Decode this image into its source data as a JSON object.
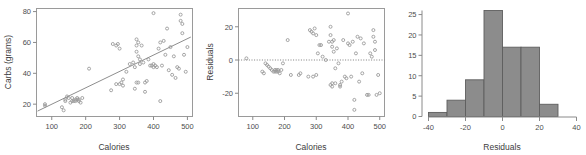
{
  "figure": {
    "title": "",
    "panel_count": 3
  },
  "chart_data": [
    {
      "id": "scatter-carbs-calories",
      "type": "scatter",
      "title": "",
      "xlabel": "Calories",
      "ylabel": "Carbs (grams)",
      "xlim": [
        55,
        515
      ],
      "ylim": [
        12,
        82
      ],
      "xticks": [
        100,
        200,
        300,
        400,
        500
      ],
      "yticks": [
        20,
        40,
        60,
        80
      ],
      "xticklabels": [
        "100",
        "200",
        "300",
        "400",
        "500"
      ],
      "yticklabels": [
        "20",
        "40",
        "60",
        "80"
      ],
      "grid": false,
      "legend": "none",
      "marker": "open-circle",
      "marker_color": "#9b9b9b",
      "fit_line": {
        "type": "linear-regression",
        "x": [
          58,
          510
        ],
        "y": [
          15.5,
          63.5
        ],
        "color": "#8e8e8e"
      },
      "x": [
        80,
        80,
        130,
        135,
        140,
        140,
        145,
        150,
        155,
        160,
        160,
        165,
        170,
        170,
        175,
        175,
        180,
        180,
        185,
        190,
        210,
        275,
        280,
        290,
        290,
        295,
        300,
        300,
        305,
        310,
        310,
        320,
        330,
        340,
        345,
        345,
        350,
        350,
        350,
        350,
        355,
        355,
        355,
        360,
        360,
        365,
        370,
        375,
        375,
        380,
        385,
        390,
        395,
        400,
        400,
        400,
        405,
        410,
        415,
        420,
        420,
        425,
        430,
        435,
        440,
        445,
        450,
        455,
        460,
        465,
        470,
        475,
        480,
        480,
        485,
        485,
        490,
        495,
        500
      ],
      "y": [
        20,
        19,
        18,
        16,
        22,
        23,
        25,
        24,
        21,
        22,
        24,
        22,
        22,
        23,
        23,
        24,
        22,
        23,
        21,
        24,
        43,
        29,
        59,
        58,
        33,
        59,
        33,
        56,
        34,
        36,
        32,
        41,
        46,
        47,
        44,
        30,
        62,
        58,
        54,
        34,
        60,
        51,
        34,
        49,
        46,
        58,
        47,
        34,
        28,
        35,
        49,
        45,
        45,
        79,
        46,
        44,
        45,
        44,
        56,
        60,
        22,
        45,
        61,
        52,
        69,
        42,
        57,
        39,
        51,
        37,
        44,
        43,
        78,
        74,
        72,
        66,
        52,
        41,
        57
      ]
    },
    {
      "id": "scatter-residuals-calories",
      "type": "scatter",
      "title": "",
      "xlabel": "Calories",
      "ylabel": "Residuals",
      "xlim": [
        55,
        515
      ],
      "ylim": [
        -34,
        31
      ],
      "xticks": [
        100,
        200,
        300,
        400,
        500
      ],
      "yticks": [
        -20,
        0,
        20
      ],
      "xticklabels": [
        "100",
        "200",
        "300",
        "400",
        "500"
      ],
      "yticklabels": [
        "-20",
        "0",
        "20"
      ],
      "grid": false,
      "legend": "none",
      "marker": "open-circle",
      "marker_color": "#9b9b9b",
      "reference_line": {
        "type": "horizontal-dotted",
        "y": 0,
        "color": "#7d7d7d"
      },
      "x": [
        80,
        130,
        135,
        140,
        145,
        150,
        155,
        160,
        165,
        170,
        170,
        175,
        175,
        180,
        180,
        185,
        190,
        195,
        210,
        220,
        245,
        250,
        275,
        280,
        285,
        290,
        290,
        295,
        300,
        300,
        305,
        310,
        315,
        320,
        330,
        340,
        345,
        345,
        345,
        350,
        350,
        350,
        350,
        355,
        355,
        360,
        360,
        365,
        370,
        375,
        375,
        380,
        385,
        390,
        395,
        400,
        400,
        405,
        410,
        415,
        420,
        420,
        425,
        430,
        435,
        440,
        445,
        450,
        460,
        465,
        470,
        475,
        480,
        480,
        485,
        485,
        490,
        495,
        500
      ],
      "y": [
        1,
        -7,
        -8,
        -2,
        -3,
        -4,
        -5,
        -6,
        -7,
        -6,
        -7,
        -6,
        -7,
        -7,
        -6,
        -8,
        -6,
        -2,
        12,
        -9,
        -9,
        -8,
        -10,
        18,
        17,
        16,
        -10,
        19,
        -9,
        15,
        4,
        9,
        9,
        2,
        0,
        11,
        20,
        15,
        -15,
        11,
        8,
        -16,
        -14,
        12,
        5,
        -5,
        -14,
        7,
        -2,
        -15,
        -16,
        -13,
        12,
        -10,
        -11,
        28,
        10,
        9,
        -10,
        11,
        -24,
        -30,
        4,
        14,
        -13,
        13,
        -8,
        10,
        -21,
        -21,
        4,
        2,
        18,
        14,
        11,
        6,
        -21,
        -9,
        -20
      ]
    },
    {
      "id": "histogram-residuals",
      "type": "bar",
      "title": "",
      "xlabel": "Residuals",
      "ylabel": "",
      "xlim": [
        -40,
        40
      ],
      "ylim": [
        0,
        26
      ],
      "xticks": [
        -40,
        -20,
        0,
        20,
        40
      ],
      "yticks": [
        0,
        5,
        10,
        15,
        20,
        25
      ],
      "xticklabels": [
        "-40",
        "-20",
        "0",
        "20",
        "40"
      ],
      "yticklabels": [
        "0",
        "5",
        "10",
        "15",
        "20",
        "25"
      ],
      "grid": false,
      "legend": "none",
      "bin_width": 10,
      "bin_edges": [
        -40,
        -30,
        -20,
        -10,
        0,
        10,
        20,
        30
      ],
      "categories": [
        "-40 to -30",
        "-30 to -20",
        "-20 to -10",
        "-10 to 0",
        "0 to 10",
        "10 to 20",
        "20 to 30"
      ],
      "values": [
        1,
        4,
        9,
        26,
        17,
        17,
        3
      ],
      "bar_color": "#8c8c8c",
      "bar_edge_color": "#5e5e5e"
    }
  ]
}
